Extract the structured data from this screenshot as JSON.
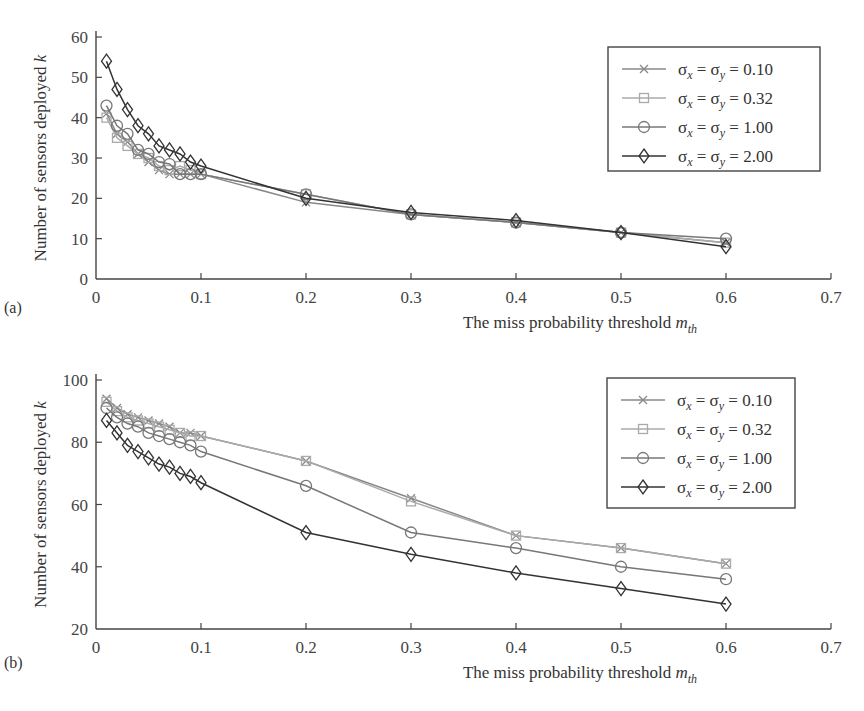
{
  "chart_data": [
    {
      "type": "line",
      "panel_label": "(a)",
      "title": "",
      "xlabel": "The miss probability threshold m_th",
      "ylabel": "Number of sensors deployed k",
      "xlim": [
        0,
        0.7
      ],
      "ylim": [
        0,
        60
      ],
      "xticks": [
        "0",
        "0.1",
        "0.2",
        "0.3",
        "0.4",
        "0.5",
        "0.6",
        "0.7"
      ],
      "yticks": [
        "0",
        "10",
        "20",
        "30",
        "40",
        "50",
        "60"
      ],
      "grid": false,
      "legend_position": "upper right",
      "x": [
        0.01,
        0.02,
        0.03,
        0.04,
        0.05,
        0.06,
        0.07,
        0.08,
        0.09,
        0.1,
        0.2,
        0.3,
        0.4,
        0.5,
        0.6
      ],
      "series": [
        {
          "name": "σx = σy = 0.10",
          "marker": "x",
          "color": "#888888",
          "values": [
            41,
            36,
            34,
            31,
            29,
            27,
            26,
            26,
            26,
            26,
            19,
            16,
            14,
            11.5,
            9
          ]
        },
        {
          "name": "σx = σy = 0.32",
          "marker": "square",
          "color": "#aaaaaa",
          "values": [
            40,
            35,
            33,
            31,
            30,
            28,
            27,
            28,
            27,
            26,
            21,
            16,
            14,
            11.5,
            9
          ]
        },
        {
          "name": "σx = σy = 1.00",
          "marker": "circle",
          "color": "#777777",
          "values": [
            43,
            38,
            36,
            32,
            31,
            29,
            28.5,
            26,
            26,
            26,
            21,
            16,
            14,
            11.5,
            10
          ]
        },
        {
          "name": "σx = σy = 2.00",
          "marker": "diamond",
          "color": "#333333",
          "values": [
            54,
            47,
            42,
            38,
            36,
            33,
            32,
            31,
            29,
            28,
            20,
            16.5,
            14.5,
            11.5,
            8
          ]
        }
      ]
    },
    {
      "type": "line",
      "panel_label": "(b)",
      "title": "",
      "xlabel": "The miss probability threshold m_th",
      "ylabel": "Number of sensors deployed k",
      "xlim": [
        0,
        0.7
      ],
      "ylim": [
        20,
        100
      ],
      "xticks": [
        "0",
        "0.1",
        "0.2",
        "0.3",
        "0.4",
        "0.5",
        "0.6",
        "0.7"
      ],
      "yticks": [
        "20",
        "40",
        "60",
        "80",
        "100"
      ],
      "grid": false,
      "legend_position": "upper right",
      "x": [
        0.01,
        0.02,
        0.03,
        0.04,
        0.05,
        0.06,
        0.07,
        0.08,
        0.09,
        0.1,
        0.2,
        0.3,
        0.4,
        0.5,
        0.6
      ],
      "series": [
        {
          "name": "σx = σy = 0.10",
          "marker": "x",
          "color": "#888888",
          "values": [
            94,
            91,
            89,
            88,
            87,
            86,
            85,
            83,
            83,
            82,
            74,
            62,
            50,
            46,
            41
          ]
        },
        {
          "name": "σx = σy = 0.32",
          "marker": "square",
          "color": "#aaaaaa",
          "values": [
            93,
            90,
            88,
            87,
            86,
            85,
            84,
            83,
            82,
            82,
            74,
            61,
            50,
            46,
            41
          ]
        },
        {
          "name": "σx = σy = 1.00",
          "marker": "circle",
          "color": "#777777",
          "values": [
            91,
            88,
            86,
            85,
            83,
            82,
            81,
            80,
            79,
            77,
            66,
            51,
            46,
            40,
            36
          ]
        },
        {
          "name": "σx = σy = 2.00",
          "marker": "diamond",
          "color": "#333333",
          "values": [
            87,
            83,
            79,
            77,
            75,
            73,
            72,
            70,
            69,
            67,
            51,
            44,
            38,
            33,
            28
          ]
        }
      ]
    }
  ],
  "labels": {
    "panel_a": "(a)",
    "panel_b": "(b)",
    "xlabel_main": "The miss probability threshold ",
    "xlabel_var": "m",
    "xlabel_sub": "th",
    "ylabel_main": "Number of sensors deployed ",
    "ylabel_var": "k"
  }
}
